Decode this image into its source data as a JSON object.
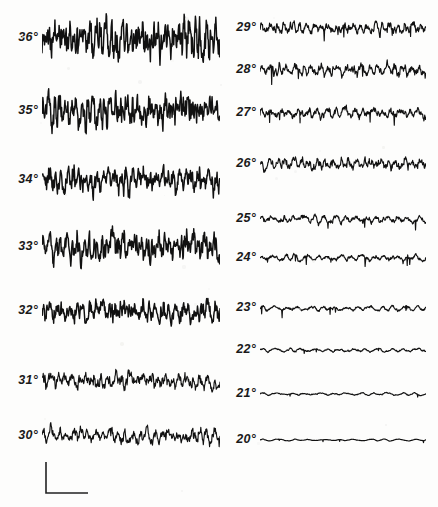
{
  "figure": {
    "type": "multi-trace-recording",
    "background_color": "#fdfdfc",
    "trace_color": "#111111",
    "label_color": "#1a1a1a",
    "width": 438,
    "height": 507,
    "degree_symbol": "°"
  },
  "scalebar": {
    "name": "calibration-scale-bar",
    "shape": "L",
    "x": 46,
    "y": 462,
    "vertical_length": 31,
    "horizontal_length": 42,
    "label": ""
  },
  "columns": [
    {
      "name": "left-column",
      "x_label_right": 38,
      "trace_x": 42,
      "trace_width": 178
    },
    {
      "name": "right-column",
      "x_label_right": 256,
      "trace_x": 260,
      "trace_width": 166
    }
  ],
  "chart_data": {
    "type": "line",
    "title": "",
    "subtitle": "",
    "xlabel": "",
    "ylabel": "",
    "legend": [],
    "grid": false,
    "axis_visible": false,
    "series_unit": "degree",
    "series": [
      {
        "name": "36°",
        "label": "36",
        "column": 0,
        "row": 0,
        "baseline_y": 38,
        "amplitude": 26,
        "frequency": 34,
        "roughness": 0.95,
        "seed": 11
      },
      {
        "name": "35°",
        "label": "35",
        "column": 0,
        "row": 1,
        "baseline_y": 111,
        "amplitude": 22,
        "frequency": 32,
        "roughness": 0.92,
        "seed": 23
      },
      {
        "name": "34°",
        "label": "34",
        "column": 0,
        "row": 2,
        "baseline_y": 180,
        "amplitude": 18,
        "frequency": 30,
        "roughness": 0.88,
        "seed": 37
      },
      {
        "name": "33°",
        "label": "33",
        "column": 0,
        "row": 3,
        "baseline_y": 247,
        "amplitude": 19,
        "frequency": 31,
        "roughness": 0.9,
        "seed": 51
      },
      {
        "name": "32°",
        "label": "32",
        "column": 0,
        "row": 4,
        "baseline_y": 311,
        "amplitude": 16,
        "frequency": 27,
        "roughness": 0.82,
        "seed": 67
      },
      {
        "name": "31°",
        "label": "31",
        "column": 0,
        "row": 5,
        "baseline_y": 381,
        "amplitude": 13,
        "frequency": 25,
        "roughness": 0.76,
        "seed": 83
      },
      {
        "name": "30°",
        "label": "30",
        "column": 0,
        "row": 6,
        "baseline_y": 436,
        "amplitude": 12,
        "frequency": 24,
        "roughness": 0.74,
        "seed": 97
      },
      {
        "name": "29°",
        "label": "29",
        "column": 1,
        "row": 0,
        "baseline_y": 28,
        "amplitude": 10,
        "frequency": 22,
        "roughness": 0.68,
        "seed": 113
      },
      {
        "name": "28°",
        "label": "28",
        "column": 1,
        "row": 1,
        "baseline_y": 70,
        "amplitude": 10,
        "frequency": 20,
        "roughness": 0.66,
        "seed": 131
      },
      {
        "name": "27°",
        "label": "27",
        "column": 1,
        "row": 2,
        "baseline_y": 113,
        "amplitude": 9,
        "frequency": 18,
        "roughness": 0.62,
        "seed": 149
      },
      {
        "name": "26°",
        "label": "26",
        "column": 1,
        "row": 3,
        "baseline_y": 164,
        "amplitude": 10,
        "frequency": 21,
        "roughness": 0.7,
        "seed": 167
      },
      {
        "name": "25°",
        "label": "25",
        "column": 1,
        "row": 4,
        "baseline_y": 219,
        "amplitude": 7,
        "frequency": 16,
        "roughness": 0.55,
        "seed": 181
      },
      {
        "name": "24°",
        "label": "24",
        "column": 1,
        "row": 5,
        "baseline_y": 258,
        "amplitude": 6,
        "frequency": 15,
        "roughness": 0.5,
        "seed": 199
      },
      {
        "name": "23°",
        "label": "23",
        "column": 1,
        "row": 6,
        "baseline_y": 308,
        "amplitude": 5,
        "frequency": 14,
        "roughness": 0.44,
        "seed": 211
      },
      {
        "name": "22°",
        "label": "22",
        "column": 1,
        "row": 7,
        "baseline_y": 350,
        "amplitude": 4,
        "frequency": 13,
        "roughness": 0.36,
        "seed": 229
      },
      {
        "name": "21°",
        "label": "21",
        "column": 1,
        "row": 8,
        "baseline_y": 394,
        "amplitude": 3,
        "frequency": 12,
        "roughness": 0.28,
        "seed": 241
      },
      {
        "name": "20°",
        "label": "20",
        "column": 1,
        "row": 9,
        "baseline_y": 440,
        "amplitude": 2,
        "frequency": 11,
        "roughness": 0.18,
        "seed": 257
      }
    ]
  }
}
